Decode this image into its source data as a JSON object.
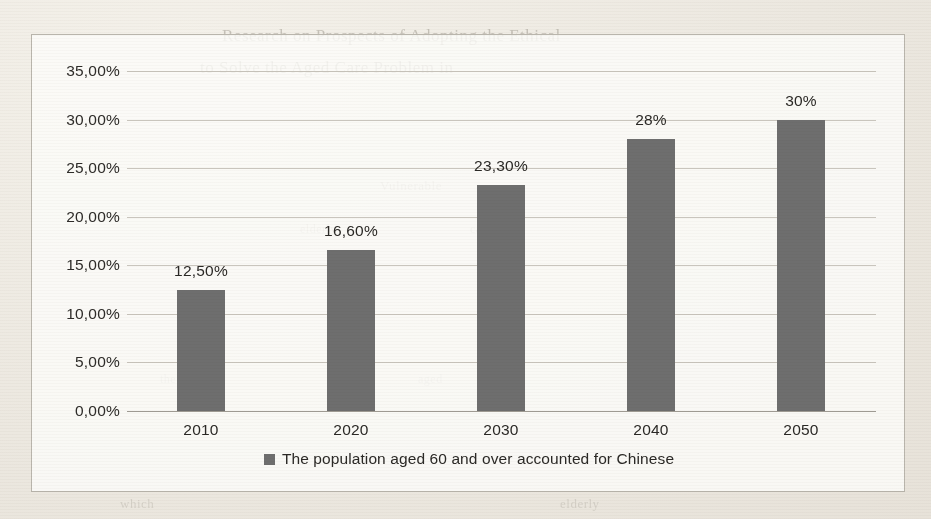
{
  "chart_data": {
    "type": "bar",
    "title": "",
    "xlabel": "",
    "ylabel": "",
    "categories": [
      "2010",
      "2020",
      "2030",
      "2040",
      "2050"
    ],
    "values": [
      12.5,
      16.6,
      23.3,
      28,
      30
    ],
    "data_labels": [
      "12,50%",
      "16,60%",
      "23,30%",
      "28%",
      "30%"
    ],
    "series": [
      {
        "name": "The population aged 60 and over accounted for Chinese",
        "values": [
          12.5,
          16.6,
          23.3,
          28,
          30
        ]
      }
    ],
    "ylim": [
      0,
      35
    ],
    "ytick_values": [
      0,
      5,
      10,
      15,
      20,
      25,
      30,
      35
    ],
    "ytick_labels": [
      "0,00%",
      "5,00%",
      "10,00%",
      "15,00%",
      "20,00%",
      "25,00%",
      "30,00%",
      "35,00%"
    ],
    "grid": true,
    "legend_position": "bottom",
    "bar_color": "#6e6e6e",
    "gridline_color": "#c9c5bd",
    "plot_background": "#fdfcfa",
    "border_color": "#b9b5ac"
  },
  "legend": {
    "entries": [
      {
        "label": "The population aged 60 and over accounted for Chinese",
        "color": "#6e6e6e"
      }
    ]
  },
  "page_background": {
    "bleed_text": [
      "Research on Prospects of Adopting the Ethical",
      "to Solve the Aged Care Problem in",
      "Vulnerable",
      "elderly",
      "care",
      "long",
      "the",
      "aged",
      "which",
      "elderly"
    ]
  }
}
